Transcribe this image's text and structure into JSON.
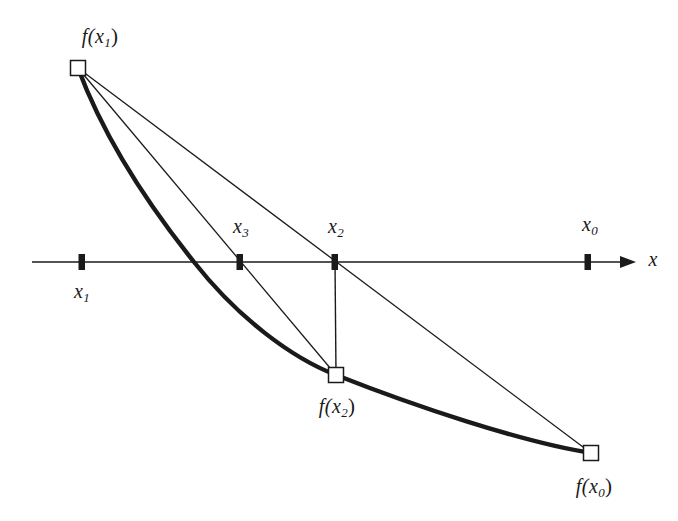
{
  "figure": {
    "type": "math-diagram",
    "method": "secant-method",
    "background_color": "#ffffff",
    "ink_color": "#1a1a1a",
    "axis": {
      "name": "x-axis",
      "label": "x",
      "label_x": 653,
      "label_y": 258,
      "start_x": 32,
      "end_x": 636,
      "y": 262,
      "stroke_width": 1.6,
      "arrow": "right"
    },
    "ticks": [
      {
        "id": "x1",
        "label": "x",
        "subscript": "1",
        "cx": 82,
        "cy": 262,
        "label_x": 82,
        "label_y": 291
      },
      {
        "id": "x3",
        "label": "x",
        "subscript": "3",
        "cx": 240,
        "cy": 262,
        "label_x": 241,
        "label_y": 226
      },
      {
        "id": "x2",
        "label": "x",
        "subscript": "2",
        "cx": 335,
        "cy": 262,
        "label_x": 336,
        "label_y": 226
      },
      {
        "id": "x0",
        "label": "x",
        "subscript": "0",
        "cx": 588,
        "cy": 262,
        "label_x": 590,
        "label_y": 224
      }
    ],
    "points": [
      {
        "id": "fx1",
        "label": "f(x",
        "subscript": "1",
        "label_tail": ")",
        "cx": 78,
        "cy": 68,
        "label_x": 100,
        "label_y": 36,
        "marker": "open-square"
      },
      {
        "id": "fx2",
        "label": "f(x",
        "subscript": "2",
        "label_tail": ")",
        "cx": 336,
        "cy": 375,
        "label_x": 337,
        "label_y": 406,
        "marker": "open-square"
      },
      {
        "id": "fx0",
        "label": "f(x",
        "subscript": "0",
        "label_tail": ")",
        "cx": 591,
        "cy": 453,
        "label_x": 594,
        "label_y": 486,
        "marker": "open-square"
      }
    ],
    "curve": {
      "name": "function-curve",
      "stroke_width": 4.2,
      "description": "f(x) decreasing convex curve from f(x1) through f(x2) to f(x0)",
      "path": "M 78 68 C 108 145, 150 205, 194 262 C 240 320, 292 358, 336 375 C 410 404, 520 442, 591 453",
      "root_crossing_x": 194
    },
    "secants": [
      {
        "id": "secant-x1-x0",
        "name": "secant-line-fx1-fx0",
        "from": [
          78,
          68
        ],
        "to": [
          591,
          453
        ],
        "through_tick": "x2",
        "stroke_width": 1.3
      },
      {
        "id": "secant-x1-x2",
        "name": "secant-line-fx1-fx2",
        "from": [
          78,
          68
        ],
        "to": [
          336,
          375
        ],
        "through_tick": "x3",
        "stroke_width": 1.3
      },
      {
        "id": "ordinate-x2",
        "name": "ordinate-line-x2",
        "from": [
          335,
          262
        ],
        "to": [
          336,
          375
        ],
        "through_tick": null,
        "stroke_width": 1.3
      }
    ]
  }
}
